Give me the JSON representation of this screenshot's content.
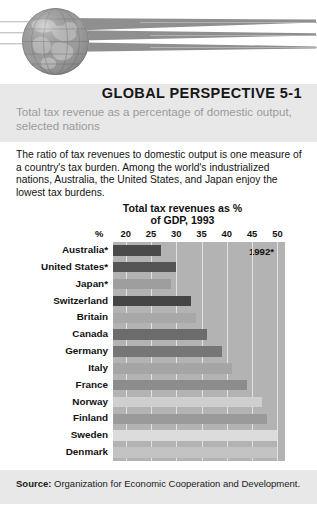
{
  "header": {
    "globe_icon": "globe-icon",
    "swoosh_icon": "speed-streak-icon",
    "stripe_count": 3
  },
  "title": {
    "heading": "GLOBAL PERSPECTIVE 5-1",
    "subtitle": "Total tax revenue as a percentage of domestic output, selected nations"
  },
  "body": {
    "paragraph": "The ratio of tax revenues to domestic output is one measure of a country's tax burden. Among the world's industrialized nations, Australia, the United States, and Japan enjoy the lowest tax burdens."
  },
  "footer": {
    "source_label": "Source:",
    "source_text": "Organization for Economic Cooperation and Development."
  },
  "chart_data": {
    "type": "bar",
    "orientation": "horizontal",
    "title": "Total tax revenues as % of GDP, 1993",
    "title_line1": "Total tax revenues as %",
    "title_line2": "of GDP, 1993",
    "xlabel": "%",
    "ylabel": "",
    "annotation": "1992*",
    "axis_unit_label": "%",
    "xlim": [
      17.5,
      51.5
    ],
    "ticks": [
      20,
      25,
      30,
      35,
      40,
      45,
      50
    ],
    "tick_labels": [
      "20",
      "25",
      "30",
      "35",
      "40",
      "45",
      "50"
    ],
    "grid": true,
    "legend": "none",
    "categories": [
      "Australia*",
      "United States*",
      "Japan*",
      "Switzerland",
      "Britain",
      "Canada",
      "Germany",
      "Italy",
      "France",
      "Norway",
      "Finland",
      "Sweden",
      "Denmark"
    ],
    "values": [
      27,
      30,
      29,
      33,
      34,
      36,
      39,
      41,
      44,
      47,
      48,
      50,
      50
    ],
    "bar_colors": [
      "#4a4a4a",
      "#555555",
      "#9e9e9e",
      "#454545",
      "#a8a8a8",
      "#6c6c6c",
      "#767676",
      "#a5a5a5",
      "#8c8c8c",
      "#cfcfcf",
      "#9a9a9a",
      "#dcdcdc",
      "#c3c3c3"
    ],
    "plot_background": "#b3b3b3",
    "gridline_color": "#e2e2e2"
  }
}
